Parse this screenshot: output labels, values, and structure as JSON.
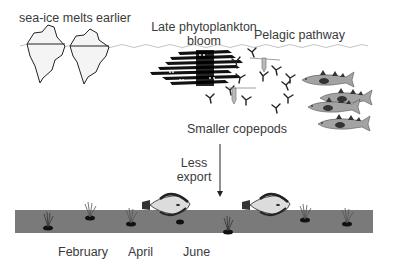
{
  "labels": {
    "sea_ice": "sea-ice melts earlier",
    "bloom_line1": "Late phytoplankton",
    "bloom_line2": "bloom",
    "pelagic": "Pelagic pathway",
    "copepods": "Smaller copepods",
    "export_line1": "Less",
    "export_line2": "export"
  },
  "timeline": {
    "months": [
      "February",
      "April",
      "June"
    ]
  },
  "colors": {
    "seafloor": "#7a7a7a",
    "fish_body": "#a0a0a0",
    "fish_dark": "#3a3a3a",
    "flatfish_body": "#d8d8d8",
    "ice_outline": "#222222",
    "water_line": "#bbbbbb"
  }
}
